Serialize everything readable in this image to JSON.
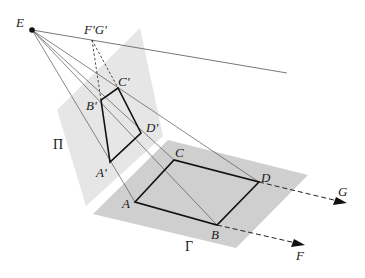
{
  "diagram": {
    "type": "perspective-projection",
    "colors": {
      "picture_plane": "#e6e6e6",
      "ground_plane": "#cfcfcf",
      "thin_line": "#555555",
      "thick_line": "#111111",
      "dashed_line": "#222222"
    },
    "points": {
      "E": {
        "label": "E",
        "x": 32,
        "y": 30
      },
      "FG_vanish": {
        "label": "F'G'",
        "x": 92,
        "y": 40
      },
      "A_prime": {
        "label": "A'",
        "x": 110,
        "y": 162
      },
      "B_prime": {
        "label": "B'",
        "x": 101,
        "y": 100
      },
      "C_prime": {
        "label": "C'",
        "x": 118,
        "y": 88
      },
      "D_prime": {
        "label": "D'",
        "x": 141,
        "y": 133
      },
      "A": {
        "label": "A",
        "x": 135,
        "y": 202
      },
      "B": {
        "label": "B",
        "x": 217,
        "y": 225
      },
      "C": {
        "label": "C",
        "x": 174,
        "y": 160
      },
      "D": {
        "label": "D",
        "x": 259,
        "y": 182
      },
      "F": {
        "label": "F",
        "x": 303,
        "y": 245
      },
      "G": {
        "label": "G",
        "x": 345,
        "y": 203
      }
    },
    "planes": {
      "picture_plane": {
        "label": "Π"
      },
      "ground_plane": {
        "label": "Γ"
      }
    }
  }
}
